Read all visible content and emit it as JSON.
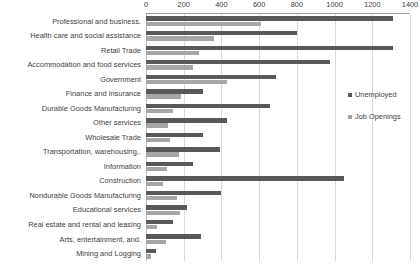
{
  "chart_data": {
    "type": "bar",
    "orientation": "horizontal",
    "title": "",
    "xlabel": "",
    "ylabel": "",
    "xlim": [
      0,
      1400
    ],
    "xticks": [
      0,
      200,
      400,
      600,
      800,
      1000,
      1200,
      1400
    ],
    "grid": true,
    "legend_position": "right",
    "categories": [
      "Professional and business.",
      "Health care and social assistance",
      "Retail Trade",
      "Accommodation and food services",
      "Government",
      "Finance and insurance",
      "Durable Goods Manufacturing",
      "Other services",
      "Wholesale Trade",
      "Transportation, warehousing,.",
      "Information",
      "Construction",
      "Nondurable Goods Manufacturing",
      "Educational services",
      "Real estate and rental and leasing",
      "Arts, entertainment, and.",
      "Mining and Logging"
    ],
    "series": [
      {
        "name": "Unemployed",
        "color": "#595959",
        "values": [
          1310,
          800,
          1310,
          975,
          690,
          300,
          660,
          430,
          300,
          395,
          250,
          1050,
          400,
          220,
          145,
          290,
          55
        ]
      },
      {
        "name": "Job Openings",
        "color": "#a6a6a6",
        "values": [
          610,
          360,
          280,
          250,
          430,
          185,
          145,
          115,
          125,
          175,
          110,
          90,
          165,
          180,
          60,
          105,
          25
        ]
      }
    ]
  },
  "axis": {
    "tick_labels": [
      "0",
      "200",
      "400",
      "600",
      "800",
      "1000",
      "1200",
      "1400"
    ]
  },
  "legend": {
    "entries": [
      {
        "label": "Unemployed"
      },
      {
        "label": "Job Openings"
      }
    ]
  }
}
